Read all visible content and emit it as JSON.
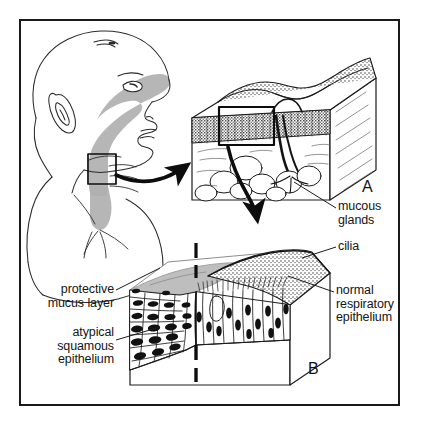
{
  "figure": {
    "type": "medical-illustration",
    "border_color": "#1a1a1a",
    "background_color": "#ffffff",
    "ink_color": "#141414",
    "mucus_gray": "#b3b3b3",
    "airway_gray": "#b0b0b0"
  },
  "panels": [
    {
      "id": "A",
      "letter": "A",
      "caption": "tracheal wall block with mucous glands"
    },
    {
      "id": "B",
      "letter": "B",
      "caption": "epithelial transition block"
    }
  ],
  "labels": [
    {
      "id": "mucous-glands",
      "text": "mucous\nglands",
      "align": "left",
      "x": 338,
      "y": 206
    },
    {
      "id": "cilia",
      "text": "cilia",
      "align": "left",
      "x": 338,
      "y": 245
    },
    {
      "id": "normal-respiratory-epithelium",
      "text": "normal\nrespiratory\nepithelium",
      "align": "left",
      "x": 336,
      "y": 290
    },
    {
      "id": "protective-mucus-layer",
      "text": "protective\nmucus layer",
      "align": "right",
      "x": 34,
      "y": 288
    },
    {
      "id": "atypical-squamous-epithelium",
      "text": "atypical\nsquamous\nepithelium",
      "align": "right",
      "x": 34,
      "y": 332
    }
  ],
  "panel_letters": [
    {
      "id": "letter-a",
      "text": "A",
      "x": 362,
      "y": 180
    },
    {
      "id": "letter-b",
      "text": "B",
      "x": 308,
      "y": 362
    }
  ],
  "anatomy": {
    "infant_head": "lateral profile of infant head and shoulder with shaded nasopharynx, oropharynx and trachea",
    "inset_box": "black rectangle over the cervical trachea",
    "panel_a_features": [
      "stippled pseudostratified epithelium",
      "submucosal gland duct",
      "mucous gland acini",
      "inset rectangle",
      "cartilage/connective tissue"
    ],
    "panel_b_features": [
      "ciliated columnar respiratory epithelium",
      "stratified atypical squamous epithelium",
      "overlying mucus layer",
      "dashed transition line"
    ]
  }
}
